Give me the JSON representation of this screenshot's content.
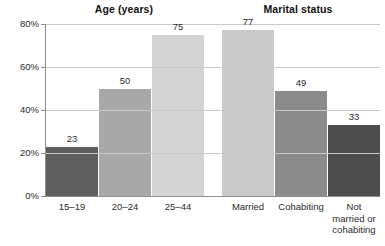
{
  "chart_data": {
    "type": "bar",
    "title": "",
    "xlabel": "",
    "ylabel": "",
    "ylim": [
      0,
      80
    ],
    "grid": true,
    "legend": "none",
    "y_tick_labels": [
      "0%",
      "20%",
      "40%",
      "60%",
      "80%"
    ],
    "y_ticks": [
      0,
      20,
      40,
      60,
      80
    ],
    "panels": [
      {
        "title": "Age (years)",
        "categories": [
          "15–19",
          "20–24",
          "25–44"
        ],
        "values": [
          23,
          50,
          75
        ],
        "value_labels": [
          "23",
          "50",
          "75"
        ],
        "colors": [
          "#5e5e5e",
          "#a8a8a8",
          "#d4d4d4"
        ]
      },
      {
        "title": "Marital status",
        "categories": [
          "Married",
          "Cohabiting",
          "Not married or cohabiting"
        ],
        "category_lines": [
          [
            "Married"
          ],
          [
            "Cohabiting"
          ],
          [
            "Not",
            "married or",
            "cohabiting"
          ]
        ],
        "values": [
          77,
          49,
          33
        ],
        "value_labels": [
          "77",
          "49",
          "33"
        ],
        "colors": [
          "#c9c9c9",
          "#8c8c8c",
          "#4d4d4d"
        ]
      }
    ]
  },
  "axis": {
    "gridline_color": "#c9c9c9",
    "baseline_color": "#8d8d8d"
  }
}
